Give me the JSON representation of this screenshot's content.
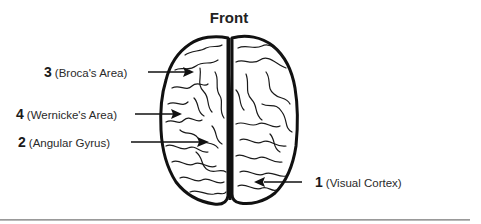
{
  "diagram": {
    "title": "Front",
    "labels": [
      {
        "number": "3",
        "name": "(Broca's Area)"
      },
      {
        "number": "4",
        "name": "(Wernicke's Area)"
      },
      {
        "number": "2",
        "name": "(Angular Gyrus)"
      },
      {
        "number": "1",
        "name": "(Visual Cortex)"
      }
    ],
    "colors": {
      "ink": "#1a1a1a",
      "background": "#ffffff",
      "rule": "#9a9a9a"
    }
  }
}
